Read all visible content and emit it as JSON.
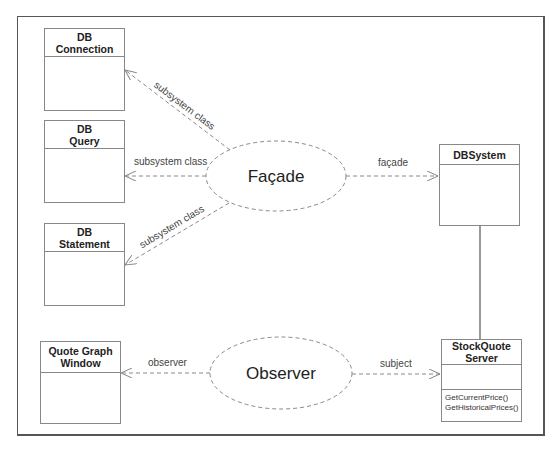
{
  "diagram": {
    "type": "uml-design-patterns",
    "classes": [
      {
        "id": "db-connection",
        "name_lines": [
          "DB",
          "Connection"
        ],
        "operations": []
      },
      {
        "id": "db-query",
        "name_lines": [
          "DB",
          "Query"
        ],
        "operations": []
      },
      {
        "id": "db-statement",
        "name_lines": [
          "DB",
          "Statement"
        ],
        "operations": []
      },
      {
        "id": "quote-graph-window",
        "name_lines": [
          "Quote Graph",
          "Window"
        ],
        "operations": []
      },
      {
        "id": "dbsystem",
        "name_lines": [
          "DBSystem"
        ],
        "operations": []
      },
      {
        "id": "stockquote-server",
        "name_lines": [
          "StockQuote",
          "Server"
        ],
        "operations": [
          "GetCurrentPrice()",
          "GetHistoricalPrices()"
        ]
      }
    ],
    "patterns": [
      {
        "id": "facade",
        "name": "Façade"
      },
      {
        "id": "observer",
        "name": "Observer"
      }
    ],
    "relations": [
      {
        "from": "facade",
        "to": "db-connection",
        "label": "subsystem class",
        "style": "dashed-arrow"
      },
      {
        "from": "facade",
        "to": "db-query",
        "label": "subsystem class",
        "style": "dashed-arrow"
      },
      {
        "from": "facade",
        "to": "db-statement",
        "label": "subsystem class",
        "style": "dashed-arrow"
      },
      {
        "from": "facade",
        "to": "dbsystem",
        "label": "façade",
        "style": "dashed-arrow"
      },
      {
        "from": "observer",
        "to": "quote-graph-window",
        "label": "observer",
        "style": "dashed-arrow"
      },
      {
        "from": "observer",
        "to": "stockquote-server",
        "label": "subject",
        "style": "dashed-arrow"
      },
      {
        "from": "dbsystem",
        "to": "stockquote-server",
        "label": "",
        "style": "solid-line"
      }
    ]
  },
  "colors": {
    "stroke": "#888888",
    "frame": "#555555",
    "text": "#222222"
  }
}
